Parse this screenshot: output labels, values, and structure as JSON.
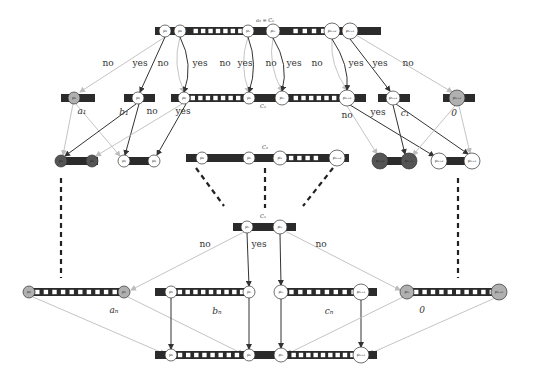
{
  "colors": {
    "bar": "#2b2b2b",
    "slot": "#ffffff",
    "node_fill": "#ffffff",
    "node_stroke": "#333333",
    "node_gray": "#b0b0b0",
    "node_dark": "#555555",
    "edge_dark": "#333333",
    "edge_light": "#bdbdbd",
    "dashed": "#222222"
  },
  "labels": {
    "top_title": "a₀ = C₁",
    "c1_label": "C₁",
    "c2_label": "C₂",
    "cn_label": "Cₙ"
  },
  "bars": [
    {
      "id": "top",
      "x": 155,
      "y": 27,
      "w": 226,
      "h": 8,
      "slots": [
        [
          192,
          244,
          7
        ],
        [
          291,
          337,
          5
        ]
      ]
    },
    {
      "id": "r1a",
      "x": 61,
      "y": 94,
      "w": 34,
      "h": 8,
      "slots": []
    },
    {
      "id": "r1b",
      "x": 124,
      "y": 94,
      "w": 31,
      "h": 8,
      "slots": []
    },
    {
      "id": "r1c",
      "x": 171,
      "y": 94,
      "w": 195,
      "h": 8,
      "slots": [
        [
          189,
          242,
          7
        ],
        [
          292,
          338,
          6
        ]
      ]
    },
    {
      "id": "r1d",
      "x": 378,
      "y": 94,
      "w": 32,
      "h": 8,
      "slots": []
    },
    {
      "id": "r1e",
      "x": 443,
      "y": 94,
      "w": 32,
      "h": 8,
      "slots": []
    },
    {
      "id": "r2a",
      "x": 60,
      "y": 157,
      "w": 38,
      "h": 8,
      "slots": []
    },
    {
      "id": "r2b",
      "x": 120,
      "y": 157,
      "w": 36,
      "h": 8,
      "slots": []
    },
    {
      "id": "c2",
      "x": 186,
      "y": 154,
      "w": 163,
      "h": 8,
      "slots": [
        [
          287,
          320,
          4
        ]
      ]
    },
    {
      "id": "r2d",
      "x": 373,
      "y": 157,
      "w": 38,
      "h": 8,
      "slots": []
    },
    {
      "id": "r2e",
      "x": 436,
      "y": 157,
      "w": 38,
      "h": 8,
      "slots": []
    },
    {
      "id": "cn",
      "x": 233,
      "y": 223,
      "w": 63,
      "h": 8,
      "slots": []
    },
    {
      "id": "b1",
      "x": 25,
      "y": 288,
      "w": 103,
      "h": 8,
      "slots": [
        [
          33,
          119,
          10
        ]
      ]
    },
    {
      "id": "b2",
      "x": 155,
      "y": 288,
      "w": 98,
      "h": 8,
      "slots": [
        [
          176,
          246,
          9
        ]
      ]
    },
    {
      "id": "b3",
      "x": 279,
      "y": 288,
      "w": 98,
      "h": 8,
      "slots": [
        [
          287,
          358,
          8
        ]
      ]
    },
    {
      "id": "b4",
      "x": 405,
      "y": 288,
      "w": 98,
      "h": 8,
      "slots": [
        [
          412,
          496,
          10
        ]
      ]
    },
    {
      "id": "bottom",
      "x": 155,
      "y": 351,
      "w": 222,
      "h": 8,
      "slots": [
        [
          176,
          241,
          8
        ],
        [
          290,
          356,
          9
        ]
      ]
    }
  ],
  "nodes": [
    {
      "x": 165,
      "y": 31,
      "r": 6,
      "label": "p₁",
      "fill": "white"
    },
    {
      "x": 180,
      "y": 31,
      "r": 6,
      "label": "p₂",
      "fill": "white"
    },
    {
      "x": 248,
      "y": 31,
      "r": 6,
      "label": "pₙ",
      "fill": "white"
    },
    {
      "x": 273,
      "y": 31,
      "r": 7,
      "label": "pₘ",
      "fill": "white"
    },
    {
      "x": 332,
      "y": 31,
      "r": 8,
      "label": "pₘ₊₂",
      "fill": "white"
    },
    {
      "x": 350,
      "y": 31,
      "r": 8,
      "label": "pₘ₊₁",
      "fill": "white"
    },
    {
      "x": 74,
      "y": 98,
      "r": 6,
      "label": "p₁",
      "fill": "gray"
    },
    {
      "x": 138,
      "y": 98,
      "r": 6,
      "label": "p₁",
      "fill": "white"
    },
    {
      "x": 184,
      "y": 98,
      "r": 6,
      "label": "p₂",
      "fill": "white"
    },
    {
      "x": 249,
      "y": 98,
      "r": 6,
      "label": "pₙ",
      "fill": "white"
    },
    {
      "x": 282,
      "y": 98,
      "r": 7,
      "label": "pₘ",
      "fill": "white"
    },
    {
      "x": 347,
      "y": 98,
      "r": 8,
      "label": "pₘ₊₂",
      "fill": "white"
    },
    {
      "x": 393,
      "y": 98,
      "r": 7,
      "label": "pₘ₊₁",
      "fill": "white"
    },
    {
      "x": 457,
      "y": 98,
      "r": 8,
      "label": "pₘ₊₁",
      "fill": "gray"
    },
    {
      "x": 61,
      "y": 161,
      "r": 6,
      "label": "p₁",
      "fill": "dark"
    },
    {
      "x": 92,
      "y": 161,
      "r": 6,
      "label": "p₂",
      "fill": "dark"
    },
    {
      "x": 124,
      "y": 161,
      "r": 6,
      "label": "p₁",
      "fill": "white"
    },
    {
      "x": 154,
      "y": 161,
      "r": 6,
      "label": "p₂",
      "fill": "white"
    },
    {
      "x": 202,
      "y": 158,
      "r": 6,
      "label": "p₂",
      "fill": "white"
    },
    {
      "x": 249,
      "y": 158,
      "r": 6,
      "label": "pₙ",
      "fill": "white"
    },
    {
      "x": 280,
      "y": 158,
      "r": 7,
      "label": "pₘ",
      "fill": "white"
    },
    {
      "x": 337,
      "y": 158,
      "r": 8,
      "label": "pₘ₊₂",
      "fill": "white"
    },
    {
      "x": 380,
      "y": 161,
      "r": 8,
      "label": "pₘ₊₂",
      "fill": "dark"
    },
    {
      "x": 409,
      "y": 161,
      "r": 8,
      "label": "pₘ₊₁",
      "fill": "dark"
    },
    {
      "x": 439,
      "y": 161,
      "r": 8,
      "label": "pₘ₊₂",
      "fill": "white"
    },
    {
      "x": 472,
      "y": 161,
      "r": 8,
      "label": "pₘ₊₁",
      "fill": "white"
    },
    {
      "x": 247,
      "y": 227,
      "r": 6,
      "label": "pₙ",
      "fill": "white"
    },
    {
      "x": 280,
      "y": 227,
      "r": 7,
      "label": "pₘ",
      "fill": "white"
    },
    {
      "x": 29,
      "y": 292,
      "r": 6,
      "label": "p₁",
      "fill": "gray"
    },
    {
      "x": 124,
      "y": 292,
      "r": 6,
      "label": "pₙ",
      "fill": "gray"
    },
    {
      "x": 171,
      "y": 292,
      "r": 6,
      "label": "p₁",
      "fill": "white"
    },
    {
      "x": 249,
      "y": 292,
      "r": 6,
      "label": "pₙ",
      "fill": "white"
    },
    {
      "x": 281,
      "y": 292,
      "r": 7,
      "label": "pₘ",
      "fill": "white"
    },
    {
      "x": 361,
      "y": 292,
      "r": 8,
      "label": "pₘ₊₁",
      "fill": "white"
    },
    {
      "x": 407,
      "y": 292,
      "r": 7,
      "label": "pₘ",
      "fill": "gray"
    },
    {
      "x": 499,
      "y": 292,
      "r": 8,
      "label": "pₘ₊₁",
      "fill": "gray"
    },
    {
      "x": 171,
      "y": 355,
      "r": 6,
      "label": "p₁",
      "fill": "white"
    },
    {
      "x": 249,
      "y": 355,
      "r": 6,
      "label": "pₙ",
      "fill": "white"
    },
    {
      "x": 281,
      "y": 355,
      "r": 7,
      "label": "pₘ",
      "fill": "white"
    },
    {
      "x": 361,
      "y": 355,
      "r": 8,
      "label": "pₘ₊₁",
      "fill": "white"
    }
  ],
  "edges": [
    {
      "x1": 165,
      "y1": 37,
      "x2": 80,
      "y2": 92,
      "tone": "light",
      "curve": 0
    },
    {
      "x1": 165,
      "y1": 37,
      "x2": 140,
      "y2": 92,
      "tone": "dark",
      "curve": 0
    },
    {
      "x1": 180,
      "y1": 37,
      "x2": 184,
      "y2": 92,
      "tone": "light",
      "curve": -10
    },
    {
      "x1": 180,
      "y1": 37,
      "x2": 184,
      "y2": 92,
      "tone": "dark",
      "curve": 12
    },
    {
      "x1": 248,
      "y1": 37,
      "x2": 249,
      "y2": 92,
      "tone": "light",
      "curve": -10
    },
    {
      "x1": 248,
      "y1": 37,
      "x2": 249,
      "y2": 92,
      "tone": "dark",
      "curve": 10
    },
    {
      "x1": 273,
      "y1": 38,
      "x2": 282,
      "y2": 91,
      "tone": "light",
      "curve": -10
    },
    {
      "x1": 273,
      "y1": 38,
      "x2": 282,
      "y2": 91,
      "tone": "dark",
      "curve": 12
    },
    {
      "x1": 332,
      "y1": 39,
      "x2": 347,
      "y2": 90,
      "tone": "light",
      "curve": -10
    },
    {
      "x1": 332,
      "y1": 39,
      "x2": 347,
      "y2": 90,
      "tone": "dark",
      "curve": 10
    },
    {
      "x1": 350,
      "y1": 39,
      "x2": 390,
      "y2": 91,
      "tone": "dark",
      "curve": 0
    },
    {
      "x1": 356,
      "y1": 35,
      "x2": 452,
      "y2": 92,
      "tone": "light",
      "curve": 0
    },
    {
      "x1": 73,
      "y1": 104,
      "x2": 63,
      "y2": 155,
      "tone": "light",
      "curve": 0
    },
    {
      "x1": 76,
      "y1": 104,
      "x2": 120,
      "y2": 156,
      "tone": "light",
      "curve": 0
    },
    {
      "x1": 136,
      "y1": 104,
      "x2": 65,
      "y2": 156,
      "tone": "dark",
      "curve": 0
    },
    {
      "x1": 139,
      "y1": 104,
      "x2": 125,
      "y2": 155,
      "tone": "dark",
      "curve": 0
    },
    {
      "x1": 182,
      "y1": 104,
      "x2": 96,
      "y2": 156,
      "tone": "light",
      "curve": 0
    },
    {
      "x1": 186,
      "y1": 104,
      "x2": 157,
      "y2": 155,
      "tone": "dark",
      "curve": 0
    },
    {
      "x1": 347,
      "y1": 106,
      "x2": 377,
      "y2": 154,
      "tone": "light",
      "curve": 0
    },
    {
      "x1": 350,
      "y1": 105,
      "x2": 434,
      "y2": 156,
      "tone": "dark",
      "curve": 0
    },
    {
      "x1": 393,
      "y1": 105,
      "x2": 405,
      "y2": 154,
      "tone": "dark",
      "curve": 0
    },
    {
      "x1": 396,
      "y1": 104,
      "x2": 468,
      "y2": 154,
      "tone": "dark",
      "curve": 0
    },
    {
      "x1": 455,
      "y1": 106,
      "x2": 413,
      "y2": 155,
      "tone": "light",
      "curve": 0
    },
    {
      "x1": 459,
      "y1": 106,
      "x2": 470,
      "y2": 153,
      "tone": "light",
      "curve": 0
    },
    {
      "x1": 244,
      "y1": 232,
      "x2": 131,
      "y2": 290,
      "tone": "light",
      "curve": 0
    },
    {
      "x1": 247,
      "y1": 233,
      "x2": 249,
      "y2": 286,
      "tone": "dark",
      "curve": 0
    },
    {
      "x1": 280,
      "y1": 234,
      "x2": 281,
      "y2": 285,
      "tone": "dark",
      "curve": 0
    },
    {
      "x1": 285,
      "y1": 231,
      "x2": 400,
      "y2": 290,
      "tone": "light",
      "curve": 0
    },
    {
      "x1": 33,
      "y1": 297,
      "x2": 165,
      "y2": 354,
      "tone": "light",
      "curve": 0
    },
    {
      "x1": 128,
      "y1": 297,
      "x2": 243,
      "y2": 354,
      "tone": "light",
      "curve": 0
    },
    {
      "x1": 171,
      "y1": 298,
      "x2": 171,
      "y2": 349,
      "tone": "dark",
      "curve": 0
    },
    {
      "x1": 249,
      "y1": 298,
      "x2": 249,
      "y2": 349,
      "tone": "dark",
      "curve": 0
    },
    {
      "x1": 281,
      "y1": 299,
      "x2": 281,
      "y2": 348,
      "tone": "dark",
      "curve": 0
    },
    {
      "x1": 361,
      "y1": 300,
      "x2": 361,
      "y2": 347,
      "tone": "dark",
      "curve": 0
    },
    {
      "x1": 403,
      "y1": 297,
      "x2": 287,
      "y2": 354,
      "tone": "light",
      "curve": 0
    },
    {
      "x1": 495,
      "y1": 298,
      "x2": 369,
      "y2": 354,
      "tone": "light",
      "curve": 0
    }
  ],
  "dashed_lines": [
    {
      "x1": 61,
      "y1": 178,
      "x2": 61,
      "y2": 278
    },
    {
      "x1": 196,
      "y1": 168,
      "x2": 224,
      "y2": 206
    },
    {
      "x1": 265,
      "y1": 168,
      "x2": 265,
      "y2": 208
    },
    {
      "x1": 333,
      "y1": 168,
      "x2": 303,
      "y2": 206
    },
    {
      "x1": 458,
      "y1": 178,
      "x2": 458,
      "y2": 278
    }
  ],
  "edge_labels": [
    {
      "x": 108,
      "y": 66,
      "text": "no"
    },
    {
      "x": 140,
      "y": 66,
      "text": "yes"
    },
    {
      "x": 163,
      "y": 66,
      "text": "no"
    },
    {
      "x": 200,
      "y": 66,
      "text": "yes"
    },
    {
      "x": 225,
      "y": 66,
      "text": "no"
    },
    {
      "x": 245,
      "y": 66,
      "text": "yes"
    },
    {
      "x": 271,
      "y": 66,
      "text": "no"
    },
    {
      "x": 294,
      "y": 66,
      "text": "yes"
    },
    {
      "x": 317,
      "y": 66,
      "text": "no"
    },
    {
      "x": 356,
      "y": 66,
      "text": "yes"
    },
    {
      "x": 380,
      "y": 66,
      "text": "yes"
    },
    {
      "x": 408,
      "y": 66,
      "text": "no"
    },
    {
      "x": 152,
      "y": 114,
      "text": "no"
    },
    {
      "x": 183,
      "y": 114,
      "text": "yes"
    },
    {
      "x": 347,
      "y": 118,
      "text": "no"
    },
    {
      "x": 378,
      "y": 115,
      "text": "yes"
    },
    {
      "x": 205,
      "y": 247,
      "text": "no"
    },
    {
      "x": 259,
      "y": 247,
      "text": "yes"
    },
    {
      "x": 321,
      "y": 247,
      "text": "no"
    }
  ],
  "value_labels": [
    {
      "x": 82,
      "y": 114,
      "text": "a₁"
    },
    {
      "x": 124,
      "y": 115,
      "text": "b₁"
    },
    {
      "x": 405,
      "y": 116,
      "text": "c₁"
    },
    {
      "x": 454,
      "y": 116,
      "text": "0"
    },
    {
      "x": 114,
      "y": 313,
      "text": "aₙ"
    },
    {
      "x": 217,
      "y": 314,
      "text": "bₙ"
    },
    {
      "x": 329,
      "y": 314,
      "text": "cₙ"
    },
    {
      "x": 422,
      "y": 313,
      "text": "0"
    }
  ],
  "bar_titles": [
    {
      "x": 265,
      "y": 22,
      "text": "a₀ = C₁"
    },
    {
      "x": 263,
      "y": 108,
      "text": "C₁"
    },
    {
      "x": 265,
      "y": 149,
      "text": "C₂"
    },
    {
      "x": 263,
      "y": 218,
      "text": "Cₙ"
    }
  ]
}
